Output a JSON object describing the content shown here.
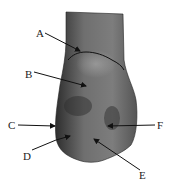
{
  "figure": {
    "colors": {
      "bone_dark": "#3a3a3a",
      "bone_mid": "#6a6a6a",
      "bone_light": "#9a9a9a",
      "arrow": "#111111",
      "background": "#ffffff"
    }
  },
  "labels": [
    {
      "id": "A",
      "text": "A",
      "x": 38,
      "y": 36,
      "tip": [
        80,
        51
      ]
    },
    {
      "id": "B",
      "text": "B",
      "x": 27,
      "y": 76,
      "tip": [
        87,
        86
      ]
    },
    {
      "id": "C",
      "text": "C",
      "x": 9,
      "y": 129,
      "tip": [
        54,
        126
      ]
    },
    {
      "id": "D",
      "text": "D",
      "x": 23,
      "y": 158,
      "tip": [
        70,
        136
      ]
    },
    {
      "id": "E",
      "text": "E",
      "x": 140,
      "y": 178,
      "tip": [
        94,
        139
      ]
    },
    {
      "id": "F",
      "text": "F",
      "x": 158,
      "y": 129,
      "tip": [
        108,
        126
      ]
    }
  ]
}
